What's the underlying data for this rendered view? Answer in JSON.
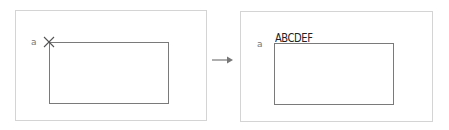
{
  "diagram": {
    "before": {
      "point_label": "a",
      "marker": "x-mark"
    },
    "transition": "arrow-right",
    "after": {
      "point_label": "a",
      "inserted_text": "ABCDEF"
    }
  }
}
